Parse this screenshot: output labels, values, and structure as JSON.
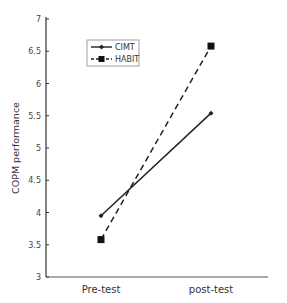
{
  "chart_data": {
    "type": "line",
    "title": "",
    "xlabel": "",
    "ylabel": "COPM performance",
    "categories": [
      "Pre-test",
      "post-test"
    ],
    "ylim": [
      3,
      7
    ],
    "yticks": [
      3,
      3.5,
      4,
      4.5,
      5,
      5.5,
      6,
      6.5,
      7
    ],
    "ytick_labels": [
      "3",
      "3.5",
      "4",
      "4.5",
      "5",
      "5.5",
      "6",
      "6.5",
      "7"
    ],
    "grid": false,
    "legend_position": "top-left",
    "series": [
      {
        "name": "CIMT",
        "values": [
          3.95,
          5.54
        ],
        "line_style": "solid",
        "marker": "diamond",
        "color": "#222222"
      },
      {
        "name": "HABIT",
        "values": [
          3.58,
          6.58
        ],
        "line_style": "dashed",
        "marker": "square",
        "color": "#222222"
      }
    ]
  }
}
